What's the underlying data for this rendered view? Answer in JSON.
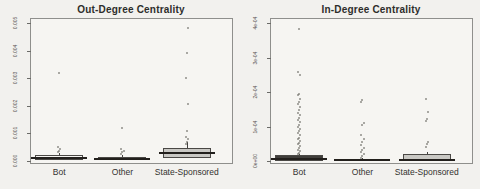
{
  "figure": {
    "background": "#f2f1ee",
    "text_color": "#2d2d2b",
    "outlier_color": "#6e6b67",
    "gray_box_fill": "#c9c8c4",
    "dark_box_fill": "#403e3b",
    "plain_box_fill": "#f6f5f2"
  },
  "chart_data": [
    {
      "type": "boxplot",
      "title": "Out-Degree Centrality",
      "xlabel": "",
      "ylabel": "",
      "grid": false,
      "legend": "none",
      "categories": [
        "Bot",
        "Other",
        "State-Sponsored"
      ],
      "ylim": [
        0,
        0.005
      ],
      "ytick_values": [
        0,
        0.001,
        0.002,
        0.003,
        0.004,
        0.005
      ],
      "ytick_labels": [
        "0.000",
        "0.001",
        "0.002",
        "0.003",
        "0.004",
        "0.005"
      ],
      "series": [
        {
          "category": "Bot",
          "whisker_low": 0,
          "q1": 5e-05,
          "median": 0.0001,
          "q3": 0.0002,
          "whisker_high": 0.0003,
          "outliers": [
            0.00032,
            0.00038,
            0.00044,
            0.00052,
            0.0032
          ],
          "box_fill": "#f6f5f2"
        },
        {
          "category": "Other",
          "whisker_low": 0,
          "q1": 3e-05,
          "median": 8e-05,
          "q3": 0.00015,
          "whisker_high": 0.0002,
          "outliers": [
            0.00026,
            0.00031,
            0.00037,
            0.00044,
            0.0012
          ],
          "box_fill": "#f6f5f2"
        },
        {
          "category": "State-Sponsored",
          "whisker_low": 0,
          "q1": 0.0001,
          "median": 0.0003,
          "q3": 0.00047,
          "whisker_high": 0.0007,
          "outliers": [
            0.0006,
            0.00068,
            0.00078,
            0.00088,
            0.00109,
            0.00207,
            0.00301,
            0.00391,
            0.00482
          ],
          "box_fill": "#c9c8c4"
        }
      ]
    },
    {
      "type": "boxplot",
      "title": "In-Degree Centrality",
      "xlabel": "",
      "ylabel": "",
      "grid": false,
      "legend": "none",
      "categories": [
        "Bot",
        "Other",
        "State-Sponsored"
      ],
      "ylim": [
        0,
        0.0004
      ],
      "ytick_values": [
        0,
        0.0001,
        0.0002,
        0.0003,
        0.0004
      ],
      "ytick_labels": [
        "0e+00",
        "1e-04",
        "2e-04",
        "3e-04",
        "4e-04"
      ],
      "series": [
        {
          "category": "Bot",
          "whisker_low": 0,
          "q1": 1e-06,
          "median": 6e-06,
          "q3": 1.6e-05,
          "whisker_high": 2e-05,
          "outliers": [
            2e-05,
            2.4e-05,
            2.8e-05,
            3.3e-05,
            3.8e-05,
            4.3e-05,
            4.8e-05,
            5.3e-05,
            5.8e-05,
            6.3e-05,
            6.8e-05,
            7.4e-05,
            8e-05,
            8.6e-05,
            9.2e-05,
            9.8e-05,
            0.000105,
            0.000112,
            0.000119,
            0.000126,
            0.000133,
            0.00014,
            0.000148,
            0.000156,
            0.000164,
            0.000172,
            0.000181,
            0.00019,
            0.000195,
            0.00025,
            0.000258,
            0.000382
          ],
          "box_fill": "#403e3b"
        },
        {
          "category": "Other",
          "whisker_low": 0,
          "q1": 5e-07,
          "median": 2e-06,
          "q3": 5e-06,
          "whisker_high": 8e-06,
          "outliers": [
            1e-05,
            1.4e-05,
            1.9e-05,
            2.5e-05,
            3.1e-05,
            3.8e-05,
            4.6e-05,
            5.5e-05,
            6.5e-05,
            7.6e-05,
            0.000104,
            0.00011,
            0.000172,
            0.000178
          ],
          "box_fill": "#f6f5f2"
        },
        {
          "category": "State-Sponsored",
          "whisker_low": 0,
          "q1": 1e-06,
          "median": 4e-06,
          "q3": 2.1e-05,
          "whisker_high": 2.5e-05,
          "outliers": [
            4e-05,
            4.8e-05,
            5.6e-05,
            0.000115,
            0.000122,
            0.000142,
            0.00018
          ],
          "box_fill": "#c9c8c4"
        }
      ]
    }
  ]
}
